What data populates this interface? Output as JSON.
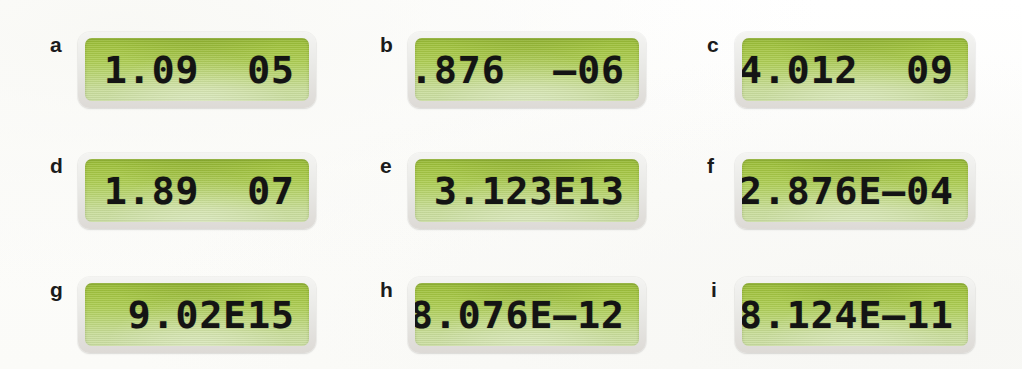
{
  "figure": {
    "background_color": "#fdfdfb",
    "rows": 3,
    "columns": 3
  },
  "display_style": {
    "lcd_top_color": "#97bb34",
    "lcd_bottom_color": "#ccdfa4",
    "bezel_color": "#e9e9e6",
    "digit_color": "#141414"
  },
  "items": [
    {
      "label": "a",
      "value": "1.09  05"
    },
    {
      "label": "b",
      "value": "2.876  –06"
    },
    {
      "label": "c",
      "value": "4.012  09"
    },
    {
      "label": "d",
      "value": "1.89  07"
    },
    {
      "label": "e",
      "value": "3.123E13"
    },
    {
      "label": "f",
      "value": "2.876E–04"
    },
    {
      "label": "g",
      "value": "9.02E15"
    },
    {
      "label": "h",
      "value": "8.076E–12"
    },
    {
      "label": "i",
      "value": "8.124E–11"
    }
  ]
}
